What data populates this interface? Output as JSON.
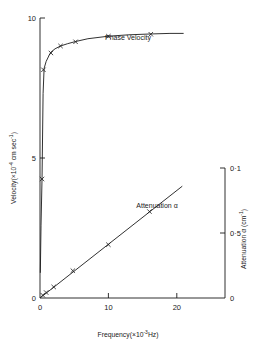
{
  "chart_data": {
    "type": "line",
    "title": "",
    "xlabel": "Frequency(×10⁻³Hz)",
    "xlabel_parts": {
      "base": "Frequency(×10",
      "exp": "-3",
      "tail": "Hz)"
    },
    "xlim": [
      0,
      25
    ],
    "xticks": [
      0,
      10,
      20
    ],
    "xticklabels": [
      "0",
      "10",
      "20"
    ],
    "grid": false,
    "legend_position": "inline-annotations",
    "left_axis": {
      "label": "Velocity(×10⁻⁴ cm sec⁻¹)",
      "label_parts": {
        "base": "Velocity(×10",
        "exp1": "-4",
        "mid": " cm sec",
        "exp2": "-1",
        "tail": ")"
      },
      "ylim": [
        0,
        10
      ],
      "yticks": [
        0,
        5,
        10
      ],
      "yticklabels": [
        "0",
        "5",
        "10"
      ]
    },
    "right_axis": {
      "label": "Attenuation α (cm⁻¹)",
      "label_parts": {
        "base": "Attenuation α (cm",
        "exp": "-1",
        "tail": ")"
      },
      "ylim": [
        0,
        1.0
      ],
      "yticks": [
        0,
        0.5,
        1.0
      ],
      "yticklabels": [
        "0",
        "0·5",
        "0·1"
      ]
    },
    "series": [
      {
        "name": "Phase Velocity",
        "annotation": "Phase Velocity",
        "axis": "left",
        "marker": "x",
        "x": [
          0.3,
          0.5,
          1.6,
          3.0,
          5.2,
          10.0,
          16.2
        ],
        "y": [
          4.25,
          8.15,
          8.75,
          9.0,
          9.15,
          9.35,
          9.42
        ],
        "curve_x": [
          0.05,
          0.15,
          0.3,
          0.45,
          0.6,
          0.9,
          1.3,
          1.6,
          2.2,
          3.0,
          4.0,
          5.2,
          7.0,
          10.0,
          13.0,
          16.2,
          19.0,
          21.0
        ],
        "curve_y": [
          0.9,
          2.6,
          4.3,
          7.3,
          8.2,
          8.45,
          8.65,
          8.78,
          8.9,
          9.0,
          9.08,
          9.16,
          9.26,
          9.35,
          9.4,
          9.43,
          9.45,
          9.45
        ]
      },
      {
        "name": "Attenuation",
        "annotation": "Attenuation α",
        "axis": "right",
        "marker": "x",
        "x": [
          0.4,
          0.9,
          2.0,
          4.8,
          10.0,
          16.0
        ],
        "y": [
          0.022,
          0.042,
          0.085,
          0.21,
          0.41,
          0.665
        ],
        "fit_line": {
          "x0": 0.0,
          "y0": 0.0,
          "x1": 20.8,
          "y1": 0.86
        }
      }
    ]
  }
}
